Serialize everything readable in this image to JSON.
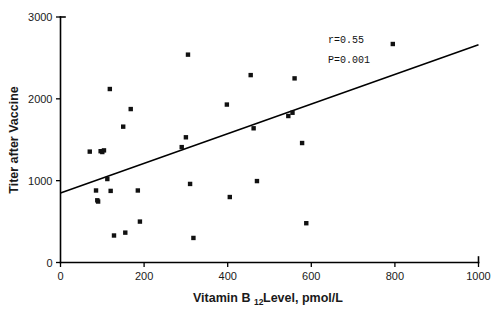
{
  "chart_data": {
    "type": "scatter",
    "title": "",
    "xlabel": "Vitamin B12 Level, pmol/L",
    "xlabel_main": "Vitamin B",
    "xlabel_sub": "12",
    "xlabel_tail": " Level, pmol/L",
    "ylabel": "Titer after Vaccine",
    "xlim": [
      0,
      1000
    ],
    "ylim": [
      0,
      3000
    ],
    "xticks": [
      0,
      200,
      400,
      600,
      800,
      1000
    ],
    "yticks": [
      0,
      1000,
      2000,
      3000
    ],
    "xtick_labels": [
      "0",
      "200",
      "400",
      "600",
      "800",
      "1000"
    ],
    "ytick_labels": [
      "0",
      "1000",
      "2000",
      "3000"
    ],
    "grid": false,
    "legend": null,
    "marker_style": "filled-square",
    "marker_color": "#111111",
    "points": [
      {
        "x": 70,
        "y": 1355
      },
      {
        "x": 85,
        "y": 880
      },
      {
        "x": 88,
        "y": 760
      },
      {
        "x": 90,
        "y": 745
      },
      {
        "x": 96,
        "y": 1360
      },
      {
        "x": 100,
        "y": 1350
      },
      {
        "x": 104,
        "y": 1370
      },
      {
        "x": 112,
        "y": 1020
      },
      {
        "x": 118,
        "y": 2120
      },
      {
        "x": 120,
        "y": 875
      },
      {
        "x": 128,
        "y": 330
      },
      {
        "x": 150,
        "y": 1660
      },
      {
        "x": 155,
        "y": 365
      },
      {
        "x": 168,
        "y": 1875
      },
      {
        "x": 185,
        "y": 880
      },
      {
        "x": 190,
        "y": 500
      },
      {
        "x": 290,
        "y": 1410
      },
      {
        "x": 300,
        "y": 1530
      },
      {
        "x": 305,
        "y": 2540
      },
      {
        "x": 310,
        "y": 960
      },
      {
        "x": 318,
        "y": 300
      },
      {
        "x": 398,
        "y": 1930
      },
      {
        "x": 405,
        "y": 800
      },
      {
        "x": 455,
        "y": 2290
      },
      {
        "x": 462,
        "y": 1640
      },
      {
        "x": 470,
        "y": 995
      },
      {
        "x": 545,
        "y": 1790
      },
      {
        "x": 555,
        "y": 1830
      },
      {
        "x": 560,
        "y": 2250
      },
      {
        "x": 578,
        "y": 1460
      },
      {
        "x": 588,
        "y": 480
      },
      {
        "x": 795,
        "y": 2670
      }
    ],
    "fit_line": {
      "x_start": 0,
      "y_start": 850,
      "x_end": 1000,
      "y_end": 2660
    },
    "annotations": [
      {
        "id": "correlation",
        "text": "r=0.55",
        "x": 640,
        "y": 2680
      },
      {
        "id": "pvalue",
        "text": "P=0.001",
        "x": 640,
        "y": 2440
      }
    ]
  }
}
